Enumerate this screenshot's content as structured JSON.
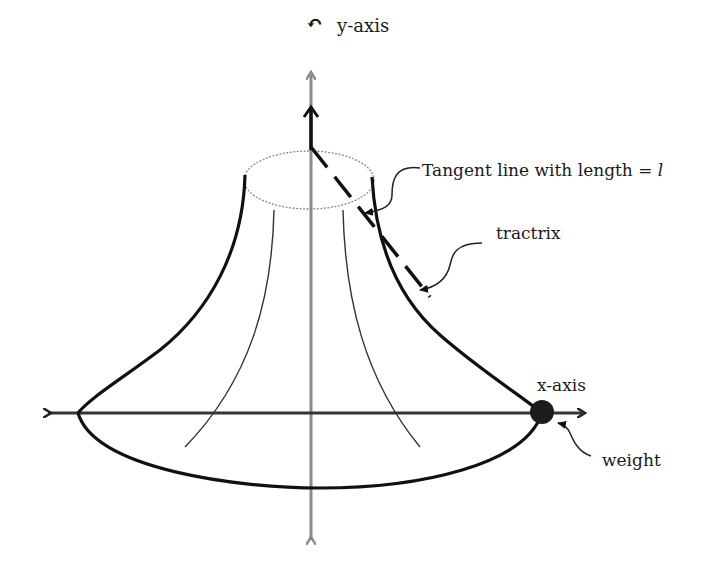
{
  "diagram": {
    "labels": {
      "y_axis": "y-axis",
      "x_axis": "x-axis",
      "tangent_line": "Tangent line with length = ",
      "tangent_length_symbol": "l",
      "tractrix": "tractrix",
      "weight": "weight",
      "rotation_symbol": "↶"
    },
    "colors": {
      "axis": "#8a8a8a",
      "outline": "#111111",
      "inner_curve": "#333333",
      "top_ellipse": "#8a8a8a",
      "weight": "#1c1c1c",
      "text": "#1a1a1a"
    },
    "elements": [
      "y-axis (vertical, gray, double-headed)",
      "x-axis (horizontal, double-headed)",
      "top dotted ellipse (rim)",
      "bottom ellipse (base)",
      "left and right tractrix outlines",
      "two inner thin tractrix curves",
      "dashed tangent line from weight to y-axis",
      "weight dot at x-axis intersection"
    ]
  }
}
